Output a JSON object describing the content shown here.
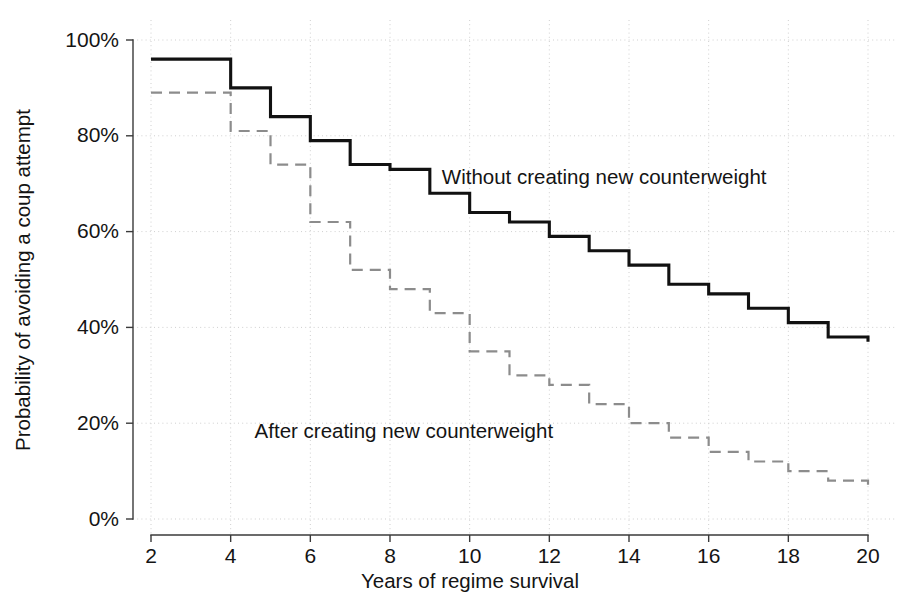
{
  "chart_data": {
    "type": "line",
    "subtype": "step-function survival curves (Kaplan-Meier style)",
    "title": "",
    "xlabel": "Years of regime survival",
    "ylabel": "Probability of avoiding a coup attempt",
    "xlim": [
      2,
      20
    ],
    "ylim": [
      0,
      100
    ],
    "grid": true,
    "legend_position": "inline-annotation",
    "x_ticks": [
      2,
      4,
      6,
      8,
      10,
      12,
      14,
      16,
      18,
      20
    ],
    "x_tick_labels": [
      "2",
      "4",
      "6",
      "8",
      "10",
      "12",
      "14",
      "16",
      "18",
      "20"
    ],
    "y_ticks": [
      0,
      20,
      40,
      60,
      80,
      100
    ],
    "y_tick_labels": [
      "0%",
      "20%",
      "40%",
      "60%",
      "80%",
      "100%"
    ],
    "x": [
      2,
      3,
      4,
      5,
      6,
      7,
      8,
      9,
      10,
      11,
      12,
      13,
      14,
      15,
      16,
      17,
      18,
      19,
      20
    ],
    "series": [
      {
        "name": "Without creating new counterweight",
        "style": "solid",
        "color": "#111111",
        "values": [
          96,
          96,
          90,
          84,
          79,
          74,
          73,
          68,
          64,
          62,
          59,
          56,
          53,
          49,
          47,
          44,
          41,
          38,
          37
        ]
      },
      {
        "name": "After creating new counterweight",
        "style": "dashed",
        "color": "#8c8c8c",
        "values": [
          89,
          89,
          81,
          74,
          62,
          52,
          48,
          43,
          35,
          30,
          28,
          24,
          20,
          17,
          14,
          12,
          10,
          8,
          7
        ]
      }
    ],
    "annotations": [
      {
        "name": "without-counterweight-label",
        "text": "Without creating new counterweight",
        "x": 9.3,
        "y": 70
      },
      {
        "name": "after-counterweight-label",
        "text": "After creating new counterweight",
        "x": 4.6,
        "y": 17
      }
    ]
  },
  "colors": {
    "background": "#ffffff",
    "axis": "#3a3a3a",
    "grid": "#cfcfcf",
    "series_solid": "#111111",
    "series_dashed": "#8c8c8c",
    "text": "#141414"
  }
}
